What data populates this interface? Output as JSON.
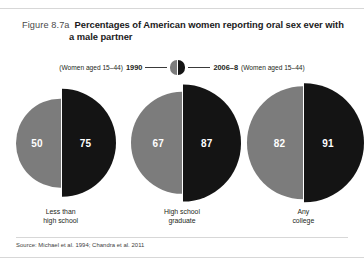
{
  "figure": {
    "number": "Figure 8.7a",
    "title": "Percentages of American women reporting oral sex ever with a male partner",
    "source": "Source: Michael et al. 1994; Chandra et al. 2011"
  },
  "legend": {
    "left_label": "(Women aged 15–44)",
    "left_series": "1990",
    "right_series": "2006–8",
    "right_label": "(Women aged 15–44)",
    "left_color": "#7c7c7c",
    "right_color": "#141414"
  },
  "chart_data": {
    "type": "pie",
    "title": "Percentages of American women reporting oral sex ever with a male partner",
    "xlabel": "",
    "ylabel": "",
    "categories": [
      "Less than high school",
      "High school graduate",
      "Any college"
    ],
    "category_lines": [
      [
        "Less than",
        "high school"
      ],
      [
        "High school",
        "graduate"
      ],
      [
        "Any",
        "college"
      ]
    ],
    "series": [
      {
        "name": "1990",
        "color": "#7c7c7c",
        "values": [
          50,
          67,
          82
        ]
      },
      {
        "name": "2006–8",
        "color": "#141414",
        "values": [
          75,
          87,
          91
        ]
      }
    ],
    "value_unit": "%",
    "ylim": [
      0,
      100
    ],
    "grid": false,
    "legend_position": "top"
  }
}
